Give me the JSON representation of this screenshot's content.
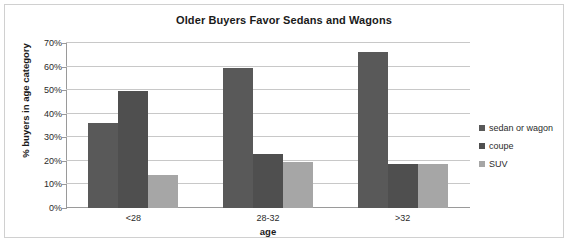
{
  "chart_data": {
    "type": "bar",
    "title": "Older Buyers Favor Sedans and Wagons",
    "xlabel": "age",
    "ylabel": "% buyers in age category",
    "categories": [
      "<28",
      "28-32",
      ">32"
    ],
    "series": [
      {
        "name": "sedan or wagon",
        "values": [
          36,
          59.5,
          66
        ],
        "color": "#595959"
      },
      {
        "name": "coupe",
        "values": [
          49.5,
          23,
          18.5
        ],
        "color": "#4f4f4f"
      },
      {
        "name": "SUV",
        "values": [
          14,
          19.5,
          18.5
        ],
        "color": "#a6a6a6"
      }
    ],
    "ylim": [
      0,
      70
    ],
    "ytick_values": [
      0,
      10,
      20,
      30,
      40,
      50,
      60,
      70
    ],
    "ytick_labels": [
      "0%",
      "10%",
      "20%",
      "30%",
      "40%",
      "50%",
      "60%",
      "70%"
    ],
    "grid": true,
    "legend_position": "right",
    "bar_gap_between_groups": true,
    "value_format": "percent"
  },
  "frame": {
    "border_color": "#d0d0d0",
    "background": "#ffffff"
  }
}
